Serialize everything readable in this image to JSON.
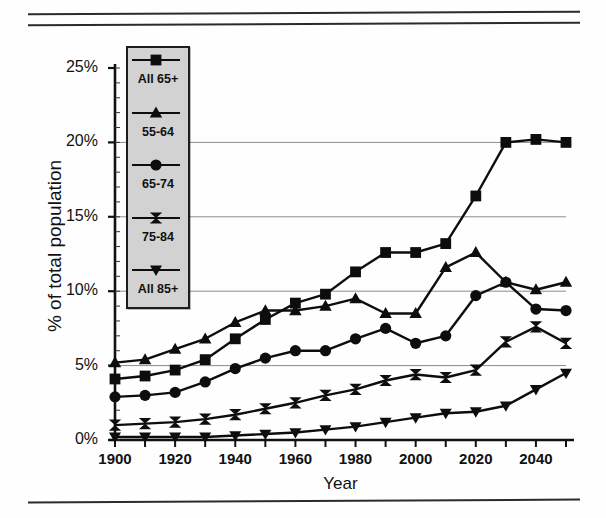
{
  "figure": {
    "ylabel": "% of total population",
    "xlabel": "Year"
  },
  "axes": {
    "y_ticks": [
      "0%",
      "5%",
      "10%",
      "15%",
      "20%",
      "25%"
    ],
    "x_ticks": [
      "1900",
      "1920",
      "1940",
      "1960",
      "1980",
      "2000",
      "2020",
      "2040"
    ]
  },
  "legend": {
    "entries": [
      {
        "label": "All 65+",
        "marker": "square"
      },
      {
        "label": "55-64",
        "marker": "triangle-up"
      },
      {
        "label": "65-74",
        "marker": "circle"
      },
      {
        "label": "75-84",
        "marker": "bowtie"
      },
      {
        "label": "All 85+",
        "marker": "triangle-down"
      }
    ]
  },
  "chart_data": {
    "type": "line",
    "title": "",
    "xlabel": "Year",
    "ylabel": "% of total population",
    "xlim": [
      1900,
      2050
    ],
    "ylim": [
      0,
      25
    ],
    "ytick_values": [
      0,
      5,
      10,
      15,
      20,
      25
    ],
    "xtick_values": [
      1900,
      1920,
      1940,
      1960,
      1980,
      2000,
      2020,
      2040
    ],
    "x_minor_tick_step": 10,
    "grid": "horizontal",
    "legend_position": "upper-left-inside",
    "x": [
      1900,
      1910,
      1920,
      1930,
      1940,
      1950,
      1960,
      1970,
      1980,
      1990,
      2000,
      2010,
      2020,
      2030,
      2040,
      2050
    ],
    "series": [
      {
        "name": "All 65+",
        "marker": "square",
        "values": [
          4.1,
          4.3,
          4.7,
          5.4,
          6.8,
          8.1,
          9.2,
          9.8,
          11.3,
          12.6,
          12.6,
          13.2,
          16.4,
          20.0,
          20.2,
          20.0
        ]
      },
      {
        "name": "55-64",
        "marker": "triangle-up",
        "values": [
          5.2,
          5.4,
          6.1,
          6.8,
          7.9,
          8.7,
          8.7,
          9.0,
          9.5,
          8.5,
          8.5,
          11.6,
          12.6,
          10.6,
          10.1,
          10.6
        ]
      },
      {
        "name": "65-74",
        "marker": "circle",
        "values": [
          2.9,
          3.0,
          3.2,
          3.9,
          4.8,
          5.5,
          6.0,
          6.0,
          6.8,
          7.5,
          6.5,
          7.0,
          9.7,
          10.6,
          8.8,
          8.7
        ]
      },
      {
        "name": "75-84",
        "marker": "bowtie",
        "values": [
          1.0,
          1.1,
          1.2,
          1.4,
          1.7,
          2.1,
          2.5,
          3.0,
          3.4,
          4.0,
          4.4,
          4.2,
          4.7,
          6.6,
          7.6,
          6.5
        ]
      },
      {
        "name": "All 85+",
        "marker": "triangle-down",
        "values": [
          0.2,
          0.2,
          0.2,
          0.2,
          0.3,
          0.4,
          0.5,
          0.7,
          0.9,
          1.2,
          1.5,
          1.8,
          1.9,
          2.3,
          3.4,
          4.5
        ]
      }
    ]
  }
}
